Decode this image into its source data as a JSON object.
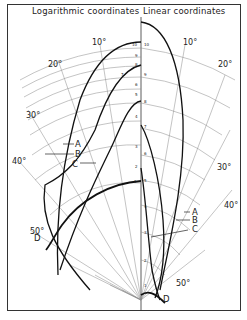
{
  "titles": {
    "left": "Logarithmic coordinates",
    "right": "Linear coordinates"
  },
  "angle_labels": {
    "left": [
      "10°",
      "20°",
      "30°",
      "40°",
      "50°"
    ],
    "right": [
      "10°",
      "20°",
      "30°",
      "40°",
      "50°"
    ]
  },
  "curve_labels": [
    "A",
    "B",
    "C",
    "D"
  ],
  "log_scale_ticks": [
    "10",
    "9",
    "8",
    "7",
    "6",
    "5",
    "4",
    "3",
    "2",
    "1"
  ],
  "linear_scale_ticks": [
    "10",
    "9",
    "8",
    "7",
    "6",
    "5",
    "4",
    "3",
    "2",
    "1"
  ],
  "colors": {
    "grid": "#888888",
    "curve": "#111111",
    "frame": "#333333",
    "background": "#ffffff"
  }
}
